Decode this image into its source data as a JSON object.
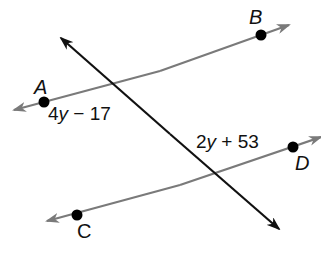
{
  "diagram": {
    "colors": {
      "parallel_line": "#7a7a7a",
      "transversal": "#111111",
      "point": "#000000",
      "background": "#ffffff"
    },
    "points": {
      "A": {
        "label": "A",
        "x": 44,
        "y": 102
      },
      "B": {
        "label": "B",
        "x": 261,
        "y": 35
      },
      "C": {
        "label": "C",
        "x": 77,
        "y": 215
      },
      "D": {
        "label": "D",
        "x": 293,
        "y": 147
      }
    },
    "lines": [
      {
        "name": "line-AB",
        "through": [
          "A",
          "B"
        ]
      },
      {
        "name": "line-CD",
        "through": [
          "C",
          "D"
        ]
      },
      {
        "name": "transversal",
        "through": []
      }
    ],
    "angle_labels": {
      "left": {
        "coef": "4",
        "var": "y",
        "rest": " − 17"
      },
      "right": {
        "coef": "2",
        "var": "y",
        "rest": " + 53"
      }
    }
  }
}
